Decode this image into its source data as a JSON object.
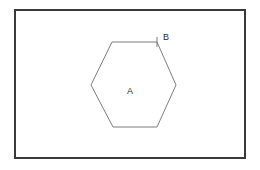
{
  "figure": {
    "background_color": "#ffffff",
    "frame": {
      "name": "outer-rectangle",
      "x": 15,
      "y": 10,
      "width": 230,
      "height": 148,
      "stroke_color": "#3a3a3a",
      "stroke_width": 2,
      "fill_color": "#ffffff"
    },
    "hexagon": {
      "name": "hexagon",
      "stroke_color": "#6e6e6e",
      "stroke_width": 0.9,
      "fill": "none",
      "points": "112,42 157,42 176,85 157,127 113,127 91,85",
      "vertices": [
        {
          "label": "top-left",
          "x": 112,
          "y": 42
        },
        {
          "label": "top-right",
          "x": 157,
          "y": 42
        },
        {
          "label": "right",
          "x": 176,
          "y": 85
        },
        {
          "label": "bottom-right",
          "x": 157,
          "y": 127
        },
        {
          "label": "bottom-left",
          "x": 113,
          "y": 127
        },
        {
          "label": "left",
          "x": 91,
          "y": 85
        }
      ]
    },
    "vertex_marker": {
      "name": "vertex-tick-mark",
      "x": 157,
      "y1": 37,
      "y2": 47,
      "stroke_color": "#6e6e6e"
    },
    "labels": [
      {
        "id": "interior-label",
        "text": "A",
        "x": 130,
        "y": 92,
        "font_size": 9,
        "color": "#2b2b2b",
        "description": "label for hexagon interior region"
      },
      {
        "id": "vertex-label",
        "text": "B",
        "x": 163,
        "y": 38,
        "font_size": 9,
        "color": "#2b2b2b",
        "description": "label for top-right vertex of hexagon"
      }
    ]
  }
}
